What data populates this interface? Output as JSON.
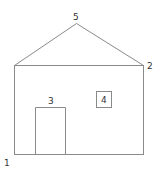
{
  "diagram": {
    "type": "house-outline",
    "line_color": "#8a8a8a",
    "label_color": "#333333",
    "labels": {
      "corner_bottom_left": "1",
      "corner_top_right": "2",
      "door": "3",
      "window": "4",
      "roof_peak": "5"
    }
  }
}
